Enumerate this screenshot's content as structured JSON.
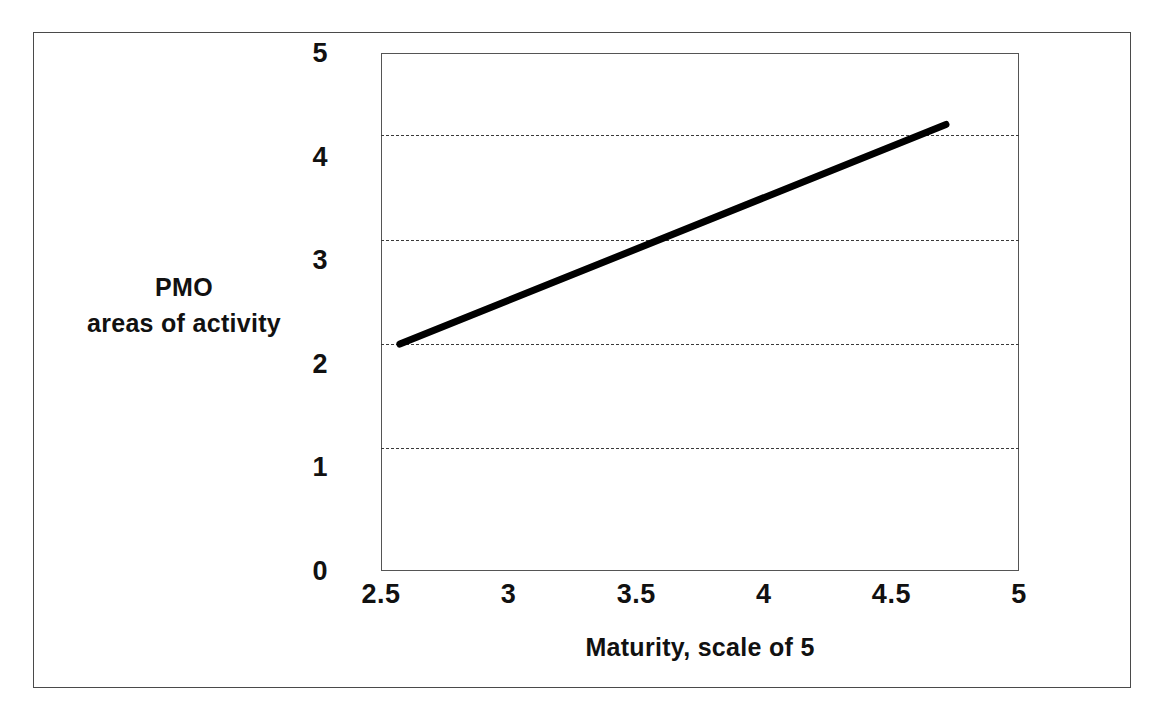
{
  "figure": {
    "border_color": "#4a4a4a",
    "background": "#ffffff"
  },
  "chart_data": {
    "type": "line",
    "title": "",
    "subtitle": "",
    "xlabel": "Maturity, scale of 5",
    "ylabel": "PMO\nareas of activity",
    "ylabel_lines": [
      "PMO",
      "areas of activity"
    ],
    "x": [
      2.57,
      4.71
    ],
    "y": [
      2.2,
      4.32
    ],
    "series": [
      {
        "name": "trend",
        "x": [
          2.57,
          4.71
        ],
        "values": [
          2.2,
          4.32
        ],
        "color": "#000000",
        "line_width": 7,
        "style": "solid"
      }
    ],
    "xlim": [
      2.5,
      5
    ],
    "ylim": [
      0,
      5
    ],
    "xticks": [
      2.5,
      3,
      3.5,
      4,
      4.5,
      5
    ],
    "xtick_labels": [
      "2.5",
      "3",
      "3.5",
      "4",
      "4.5",
      "5"
    ],
    "yticks": [
      0,
      1,
      2,
      3,
      4,
      5
    ],
    "ytick_labels": [
      "0",
      "1",
      "2",
      "3",
      "4",
      "5"
    ],
    "gridlines": {
      "horizontal_values": [
        1.2,
        2.2,
        3.2,
        4.22
      ],
      "style": "dashed",
      "color": "#3a3a3a",
      "vertical": false
    },
    "grid": true,
    "legend": null,
    "legend_position": "none",
    "annotations": [],
    "plot_border": true
  },
  "axes": {
    "y_ticks": [
      {
        "label": "5",
        "value": 5
      },
      {
        "label": "4",
        "value": 4
      },
      {
        "label": "3",
        "value": 3
      },
      {
        "label": "2",
        "value": 2
      },
      {
        "label": "1",
        "value": 1
      },
      {
        "label": "0",
        "value": 0
      }
    ],
    "x_ticks": [
      {
        "label": "2.5",
        "value": 2.5
      },
      {
        "label": "3",
        "value": 3
      },
      {
        "label": "3.5",
        "value": 3.5
      },
      {
        "label": "4",
        "value": 4
      },
      {
        "label": "4.5",
        "value": 4.5
      },
      {
        "label": "5",
        "value": 5
      }
    ],
    "x_title": "Maturity, scale of 5",
    "y_title_line1": "PMO",
    "y_title_line2": "areas of activity"
  }
}
